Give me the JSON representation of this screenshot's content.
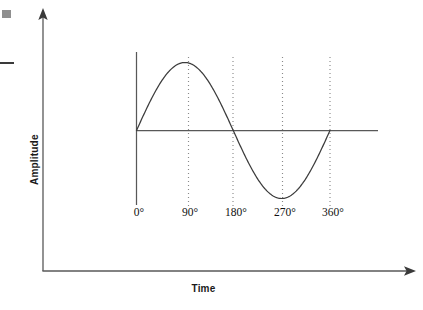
{
  "figure": {
    "kind": "sine-wave-diagram",
    "background_color": "#ffffff",
    "axis_color": "#585858",
    "curve_color": "#3c3c3c",
    "guide_color": "#8a8a8a",
    "text_color": "#111111",
    "artifact_color": "#8f8f8f"
  },
  "axes": {
    "y_title": "Amplitude",
    "x_title": "Time"
  },
  "chart_data": {
    "type": "line",
    "title": "",
    "subtitle": "",
    "xlabel": "Time",
    "ylabel": "Amplitude",
    "grid": false,
    "legend": null,
    "annotations": [],
    "xlim": [
      0,
      360
    ],
    "ylim": [
      -1,
      1
    ],
    "xtick_labels": [
      "0°",
      "90°",
      "180°",
      "270°",
      "360°"
    ],
    "xticks": [
      0,
      90,
      180,
      270,
      360
    ],
    "ytick_labels": [],
    "yticks": [],
    "series": [
      {
        "name": "sine",
        "function": "sin",
        "amplitude": 1,
        "period_degrees": 360,
        "x": [
          0,
          15,
          30,
          45,
          60,
          75,
          90,
          105,
          120,
          135,
          150,
          165,
          180,
          195,
          210,
          225,
          240,
          255,
          270,
          285,
          300,
          315,
          330,
          345,
          360
        ],
        "values": [
          0,
          0.259,
          0.5,
          0.707,
          0.866,
          0.966,
          1,
          0.966,
          0.866,
          0.707,
          0.5,
          0.259,
          0,
          -0.259,
          -0.5,
          -0.707,
          -0.866,
          -0.966,
          -1,
          -0.966,
          -0.866,
          -0.707,
          -0.5,
          -0.259,
          0
        ]
      }
    ],
    "key_points": [
      {
        "label": "0°",
        "x": 0,
        "y": 0
      },
      {
        "label": "90°",
        "x": 90,
        "y": 1
      },
      {
        "label": "180°",
        "x": 180,
        "y": 0
      },
      {
        "label": "270°",
        "x": 270,
        "y": -1
      },
      {
        "label": "360°",
        "x": 360,
        "y": 0
      }
    ],
    "guide_lines_at": [
      90,
      180,
      270,
      360
    ]
  },
  "ticks": [
    {
      "label": "0°",
      "px": 139
    },
    {
      "label": "90°",
      "px": 190
    },
    {
      "label": "180°",
      "px": 236
    },
    {
      "label": "270°",
      "px": 285
    },
    {
      "label": "360°",
      "px": 333
    }
  ]
}
